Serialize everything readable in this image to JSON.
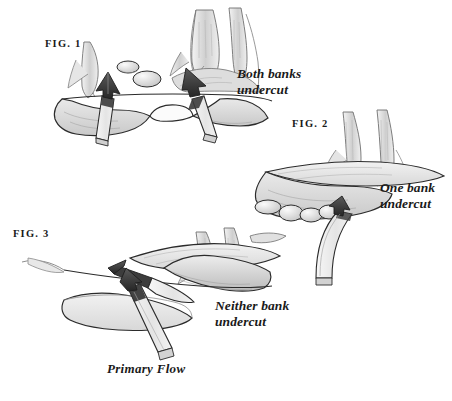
{
  "figure": {
    "background_color": "#ffffff",
    "ink_color": "#1a1a1a"
  },
  "labels": {
    "fig1": "FIG. 1",
    "fig2": "FIG. 2",
    "fig3": "FIG. 3",
    "both_banks": "Both banks\nundercut",
    "one_bank": "One bank\nundercut",
    "neither_bank": "Neither bank\nundercut",
    "primary_flow": "Primary Flow"
  },
  "panels": [
    {
      "id": "fig1",
      "caption": "FIG. 1",
      "annotation": "Both banks undercut",
      "arrows": 2,
      "arrow_direction": "up",
      "features": [
        "left-bank",
        "right-bank",
        "two-rocks",
        "tree-roots",
        "water-surface-line"
      ]
    },
    {
      "id": "fig2",
      "caption": "FIG. 2",
      "annotation": "One bank undercut",
      "arrows": 1,
      "arrow_direction": "curved-up-right",
      "features": [
        "undercut-bank",
        "boulders",
        "tree-trunks",
        "water-surface-line"
      ]
    },
    {
      "id": "fig3",
      "caption": "FIG. 3",
      "annotation": "Neither bank undercut",
      "arrows": 2,
      "arrow_direction": "crossing",
      "flow_label": "Primary Flow",
      "features": [
        "gravel-bar",
        "tree-roots",
        "water-surface-line"
      ]
    }
  ],
  "colors": {
    "ink": "#1a1a1a",
    "bank_fill": "#d6d6d6",
    "bank_fill_light": "#e6e6e6",
    "ribbon_fill": "#ededed",
    "arrowhead_dark": "#3a3a3a",
    "arrowhead_mid": "#6e6e6e",
    "shadow": "#bdbdbd",
    "background": "#ffffff"
  }
}
